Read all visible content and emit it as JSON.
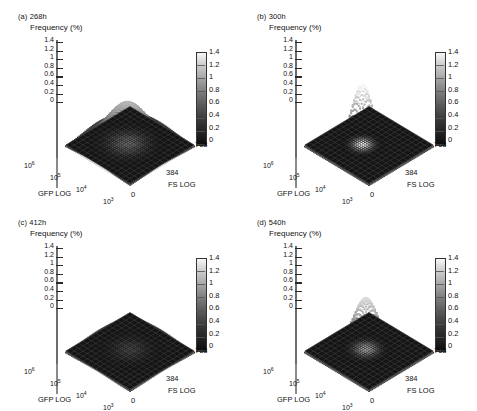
{
  "figure": {
    "type": "figure-2x2-surface-grid",
    "axis_titles": {
      "z": "Frequency (%)",
      "x": "GFP LOG",
      "y": "FS LOG"
    },
    "z_ticks": [
      "1.4",
      "1.2",
      "1",
      "0.8",
      "0.6",
      "0.4",
      "0.2",
      "0"
    ],
    "colorbar_ticks": [
      "1.4",
      "1.2",
      "1",
      "0.8",
      "0.6",
      "0.4",
      "0.2",
      "0"
    ],
    "x_ticks": [
      "10",
      "10",
      "10",
      "10"
    ],
    "x_tick_exponents": [
      "6",
      "5",
      "4",
      "3"
    ],
    "y_ticks": [
      "768",
      "384",
      "0"
    ],
    "colors": {
      "surface_light": "#f2f2f2",
      "surface_mid": "#9a9a9a",
      "surface_dark": "#3a3a3a",
      "floor_dark": "#141414",
      "floor_grid": "#4a4a4a",
      "axis": "#2a2a2a",
      "text": "#111111"
    }
  },
  "panels": [
    {
      "id": "a",
      "label": "(a) 268h",
      "time_hours": 268,
      "peak_height": 0.95,
      "peak_width": 0.3,
      "peak_cx": 0.5,
      "peak_cy": 0.46
    },
    {
      "id": "b",
      "label": "(b) 300h",
      "time_hours": 300,
      "peak_height": 1.42,
      "peak_width": 0.155,
      "peak_cx": 0.455,
      "peak_cy": 0.44
    },
    {
      "id": "c",
      "label": "(c) 412h",
      "time_hours": 412,
      "peak_height": 0.72,
      "peak_width": 0.28,
      "peak_cx": 0.52,
      "peak_cy": 0.48
    },
    {
      "id": "d",
      "label": "(d) 540h",
      "time_hours": 540,
      "peak_height": 1.2,
      "peak_width": 0.19,
      "peak_cx": 0.5,
      "peak_cy": 0.45
    }
  ],
  "chart_data": {
    "type": "surface",
    "title": "",
    "xlabel": "GFP LOG",
    "ylabel": "FS LOG",
    "zlabel": "Frequency (%)",
    "zlim": [
      0,
      1.4
    ],
    "xlim_log10": [
      3,
      6
    ],
    "ylim": [
      0,
      768
    ],
    "grid": true,
    "legend": "colorbar-right",
    "colorbar_range": [
      0,
      1.4
    ],
    "series": [
      {
        "name": "(a) 268h",
        "peak_frequency_pct": 0.95,
        "peak_gfp_log10": 4.7,
        "peak_fs": 384,
        "shape": "broad-moderate-unimodal"
      },
      {
        "name": "(b) 300h",
        "peak_frequency_pct": 1.42,
        "peak_gfp_log10": 4.8,
        "peak_fs": 400,
        "shape": "tall-sharp-unimodal"
      },
      {
        "name": "(c) 412h",
        "peak_frequency_pct": 0.72,
        "peak_gfp_log10": 4.6,
        "peak_fs": 370,
        "shape": "broad-low-unimodal"
      },
      {
        "name": "(d) 540h",
        "peak_frequency_pct": 1.2,
        "peak_gfp_log10": 4.7,
        "peak_fs": 390,
        "shape": "tall-narrow-unimodal"
      }
    ]
  }
}
